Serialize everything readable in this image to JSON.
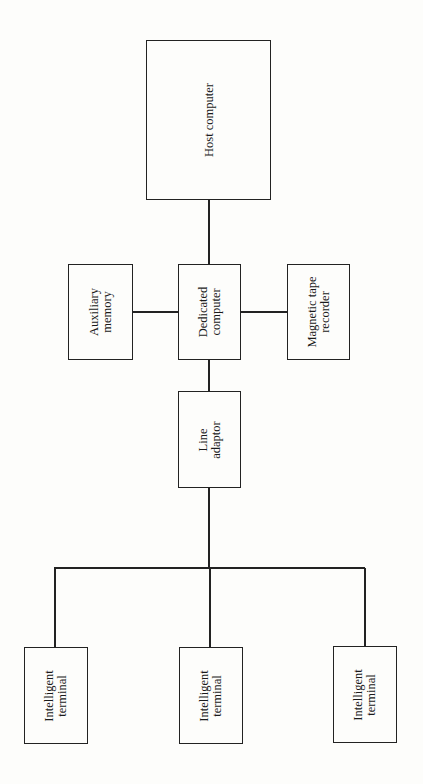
{
  "diagram": {
    "type": "block-diagram",
    "orientation": "rotated-90",
    "nodes": {
      "host": {
        "lines": [
          "Host computer"
        ]
      },
      "aux": {
        "lines": [
          "Auxiliary",
          "memory"
        ]
      },
      "dedicated": {
        "lines": [
          "Dedicated",
          "computer"
        ]
      },
      "tape": {
        "lines": [
          "Magnetic tape",
          "recorder"
        ]
      },
      "adaptor": {
        "lines": [
          "Line",
          "adaptor"
        ]
      },
      "term1": {
        "lines": [
          "Intelligent",
          "terminal"
        ]
      },
      "term2": {
        "lines": [
          "Intelligent",
          "terminal"
        ]
      },
      "term3": {
        "lines": [
          "Intelligent",
          "terminal"
        ]
      }
    },
    "edges": [
      [
        "host",
        "dedicated"
      ],
      [
        "aux",
        "dedicated"
      ],
      [
        "dedicated",
        "tape"
      ],
      [
        "dedicated",
        "adaptor"
      ],
      [
        "adaptor",
        "term1"
      ],
      [
        "adaptor",
        "term2"
      ],
      [
        "adaptor",
        "term3"
      ]
    ]
  }
}
